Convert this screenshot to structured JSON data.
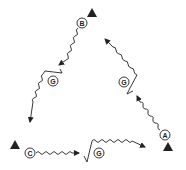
{
  "diagram": {
    "type": "drill-diagram",
    "colors": {
      "ink": "#222222",
      "background": "#ffffff"
    },
    "players": [
      {
        "id": "A",
        "label": "A",
        "x": 165,
        "y": 135
      },
      {
        "id": "B",
        "label": "B",
        "x": 82,
        "y": 23
      },
      {
        "id": "C",
        "label": "C",
        "x": 30,
        "y": 153
      },
      {
        "id": "G1",
        "label": "G",
        "x": 53,
        "y": 81
      },
      {
        "id": "G2",
        "label": "G",
        "x": 124,
        "y": 82
      },
      {
        "id": "G3",
        "label": "G",
        "x": 99,
        "y": 153
      }
    ],
    "cones": [
      {
        "id": "cone-top",
        "x": 92,
        "y": 13
      },
      {
        "id": "cone-left",
        "x": 15,
        "y": 145
      },
      {
        "id": "cone-right",
        "x": 168,
        "y": 147
      }
    ],
    "icons": {
      "cone": "triangle-icon",
      "player": "circle-icon",
      "dribble": "wavy-arrow-icon"
    }
  }
}
